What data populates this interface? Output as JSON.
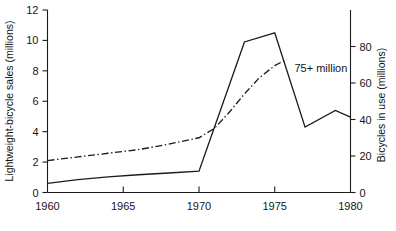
{
  "chart_data": {
    "type": "line",
    "title": "",
    "xlabel": "",
    "ylabel": "Lightweight-bicycle sales (millions)",
    "y2label": "Bicycles in use (millions)",
    "xlim": [
      1960,
      1980
    ],
    "ylim": [
      0,
      12
    ],
    "y2lim": [
      0,
      100
    ],
    "grid": false,
    "legend": "none",
    "xticks": [
      1960,
      1965,
      1970,
      1975,
      1980
    ],
    "xtick_labels": [
      "1960",
      "1965",
      "1970",
      "1975",
      "1980"
    ],
    "yticks": [
      0,
      2,
      4,
      6,
      8,
      10,
      12
    ],
    "ytick_labels": [
      "0",
      "2",
      "4",
      "6",
      "8",
      "10",
      "12"
    ],
    "y2ticks": [
      0,
      20,
      40,
      60,
      80
    ],
    "y2tick_labels": [
      "0",
      "20",
      "40",
      "60",
      "80"
    ],
    "series": [
      {
        "name": "Lightweight bicycle sales",
        "style": "solid",
        "axis": "left",
        "points": [
          [
            1960,
            0.6
          ],
          [
            1962,
            0.85
          ],
          [
            1964,
            1.03
          ],
          [
            1966,
            1.17
          ],
          [
            1968,
            1.28
          ],
          [
            1970,
            1.4
          ],
          [
            1973,
            9.9
          ],
          [
            1975,
            10.5
          ],
          [
            1977,
            4.3
          ],
          [
            1979,
            5.4
          ],
          [
            1980,
            4.95
          ]
        ]
      },
      {
        "name": "Bicycles in use",
        "style": "dash-dot",
        "axis": "right",
        "points": [
          [
            1960,
            17.5
          ],
          [
            1962,
            19.5
          ],
          [
            1964,
            21.5
          ],
          [
            1966,
            23.5
          ],
          [
            1968,
            26.5
          ],
          [
            1970,
            30.0
          ],
          [
            1971,
            35.0
          ],
          [
            1972,
            44.0
          ],
          [
            1973,
            54.0
          ],
          [
            1974,
            63.0
          ],
          [
            1975,
            69.5
          ],
          [
            1975.8,
            73.0
          ]
        ]
      }
    ],
    "annotations": [
      {
        "text": "75+ million",
        "x": 1976.3,
        "y": 7.9,
        "axis": "left"
      }
    ]
  }
}
